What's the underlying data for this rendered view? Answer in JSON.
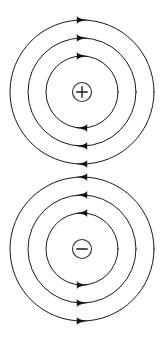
{
  "figure": {
    "background_color": "#ffffff",
    "line_color": "#1a1a1a",
    "arrow_color": "#121212",
    "width": 166,
    "height": 341
  },
  "diagrams": [
    {
      "id": "positive-charge-field",
      "charge_label": "+",
      "charge_sign": "positive",
      "charge_symbol_name": "plus-sign",
      "circulation": "clockwise",
      "center_x": 82,
      "center_y": 92,
      "charge_radius": 9.5,
      "rings": [
        {
          "radius": 36,
          "stroke_width": 1.0,
          "arrow_angles": [
            90,
            270
          ]
        },
        {
          "radius": 54,
          "stroke_width": 1.0,
          "arrow_angles": [
            90,
            270
          ]
        },
        {
          "radius": 72,
          "stroke_width": 1.0,
          "arrow_angles": [
            90,
            270
          ]
        }
      ],
      "arrow_directions": {
        "top": "right",
        "right": "down",
        "bottom": "left",
        "left": "up"
      }
    },
    {
      "id": "negative-charge-field",
      "charge_label": "−",
      "charge_sign": "negative",
      "charge_symbol_name": "minus-sign",
      "circulation": "counter-clockwise",
      "center_x": 82,
      "center_y": 249,
      "charge_radius": 9.5,
      "rings": [
        {
          "radius": 36,
          "stroke_width": 1.0,
          "arrow_angles": [
            90,
            270
          ]
        },
        {
          "radius": 54,
          "stroke_width": 1.0,
          "arrow_angles": [
            90,
            270
          ]
        },
        {
          "radius": 72,
          "stroke_width": 1.0,
          "arrow_angles": [
            90,
            270
          ]
        }
      ],
      "arrow_directions": {
        "top": "left",
        "right": "up",
        "bottom": "right",
        "left": "down"
      }
    }
  ]
}
